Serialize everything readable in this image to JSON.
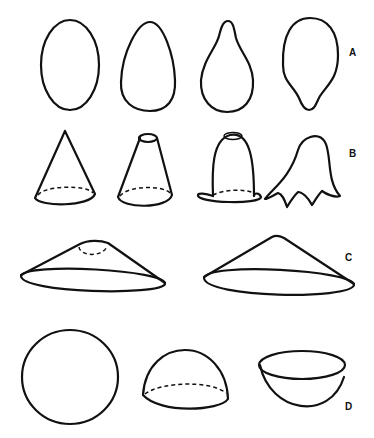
{
  "figure": {
    "type": "line-drawing",
    "rows": [
      {
        "label": "A",
        "shapes": [
          "oval",
          "egg",
          "pear / teardrop",
          "inverted pear"
        ]
      },
      {
        "label": "B",
        "shapes": [
          "cone",
          "truncated cone",
          "bell",
          "tulip bell with petals"
        ]
      },
      {
        "label": "C",
        "shapes": [
          "shallow truncated cone (lampshade)",
          "shallow cone"
        ]
      },
      {
        "label": "D",
        "shapes": [
          "sphere / circle",
          "hemisphere dome",
          "hemispherical bowl"
        ]
      }
    ]
  },
  "labels": {
    "a": "A",
    "b": "B",
    "c": "C",
    "d": "D"
  },
  "colors": {
    "ink": "#111111",
    "background": "#ffffff"
  }
}
